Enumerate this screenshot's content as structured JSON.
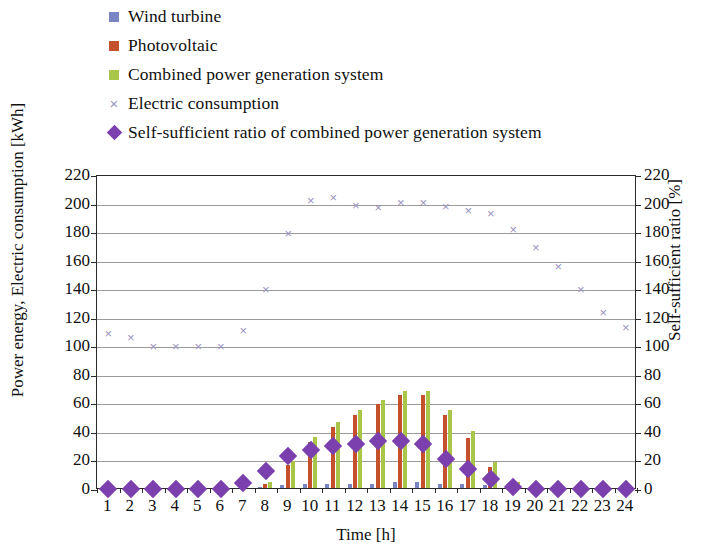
{
  "legend": {
    "items": [
      {
        "label": "Wind turbine",
        "marker": "square",
        "color": "#7b85c4",
        "name": "legend-item-wind-turbine"
      },
      {
        "label": "Photovoltaic",
        "marker": "square",
        "color": "#c4512c",
        "name": "legend-item-photovoltaic"
      },
      {
        "label": "Combined power generation system",
        "marker": "square",
        "color": "#a9c648",
        "name": "legend-item-combined"
      },
      {
        "label": "Electric consumption",
        "marker": "cross",
        "color": "#9a93c0",
        "name": "legend-item-electric-consumption"
      },
      {
        "label": "Self-sufficient ratio of combined power generation system",
        "marker": "diamond",
        "color": "#7b3fae",
        "name": "legend-item-self-sufficient-ratio"
      }
    ]
  },
  "axes": {
    "left_title": "Power energy, Electric consumption [kWh]",
    "right_title": "Self-sufficient ratio [%]",
    "x_title": "Time [h]",
    "y_ticks": [
      0,
      20,
      40,
      60,
      80,
      100,
      120,
      140,
      160,
      180,
      200,
      220
    ],
    "y2_ticks": [
      0,
      20,
      40,
      60,
      80,
      100,
      120,
      140,
      160,
      180,
      200,
      220
    ]
  },
  "chart_data": {
    "type": "bar",
    "title": "",
    "xlabel": "Time [h]",
    "ylabel": "Power energy, Electric consumption [kWh]",
    "y2label": "Self-sufficient ratio [%]",
    "ylim": [
      0,
      220
    ],
    "y2lim": [
      0,
      220
    ],
    "grid": true,
    "legend_position": "top-left",
    "categories": [
      1,
      2,
      3,
      4,
      5,
      6,
      7,
      8,
      9,
      10,
      11,
      12,
      13,
      14,
      15,
      16,
      17,
      18,
      19,
      20,
      21,
      22,
      23,
      24
    ],
    "series": [
      {
        "name": "Wind turbine",
        "type": "bar",
        "color": "#7b85c4",
        "axis": "left",
        "values": [
          0,
          0,
          0,
          0,
          0,
          0,
          0,
          1,
          2,
          3,
          3,
          3,
          3,
          4,
          4,
          3,
          3,
          2,
          0,
          0,
          0,
          0,
          0,
          0
        ]
      },
      {
        "name": "Photovoltaic",
        "type": "bar",
        "color": "#c4512c",
        "axis": "left",
        "values": [
          0,
          0,
          0,
          0,
          0,
          0,
          0,
          3,
          16,
          32,
          43,
          51,
          59,
          65,
          65,
          51,
          35,
          15,
          3,
          0,
          0,
          0,
          0,
          0
        ]
      },
      {
        "name": "Combined power generation system",
        "type": "bar",
        "color": "#a9c648",
        "axis": "left",
        "values": [
          0,
          0,
          0,
          0,
          0,
          0,
          0,
          4,
          19,
          36,
          46,
          55,
          62,
          68,
          68,
          55,
          40,
          18,
          4,
          0,
          0,
          0,
          0,
          0
        ]
      },
      {
        "name": "Electric consumption",
        "type": "scatter",
        "color": "#9a93c0",
        "axis": "left",
        "values": [
          110,
          107,
          101,
          101,
          101,
          101,
          112,
          141,
          180,
          203,
          205,
          200,
          198,
          202,
          202,
          199,
          196,
          194,
          183,
          170,
          157,
          141,
          125,
          114
        ]
      },
      {
        "name": "Self-sufficient ratio of combined power generation system",
        "type": "scatter",
        "color": "#7b3fae",
        "axis": "right",
        "values": [
          1,
          1,
          1,
          1,
          1,
          1,
          5,
          13,
          24,
          28,
          31,
          32,
          34,
          34,
          32,
          22,
          15,
          8,
          2,
          1,
          1,
          1,
          1,
          1
        ]
      }
    ]
  }
}
